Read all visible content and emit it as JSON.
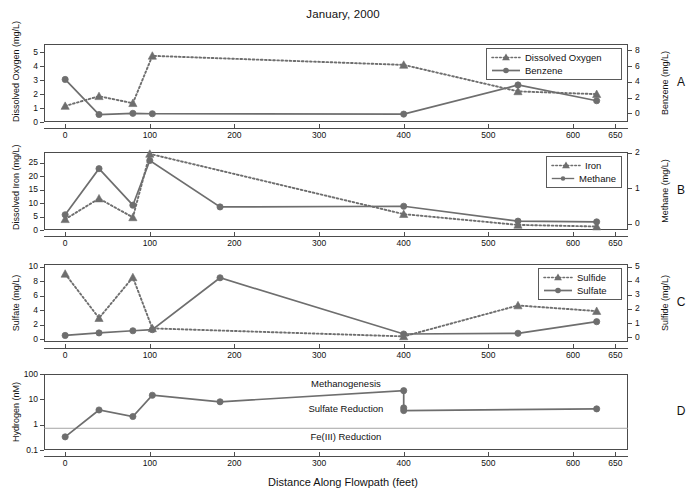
{
  "figure": {
    "title": "January, 2000",
    "xaxis_title": "Distance Along Flowpath (feet)",
    "xticks": [
      "0",
      "100",
      "200",
      "300",
      "400",
      "500",
      "600",
      "650"
    ],
    "xtick_values": [
      0,
      100,
      200,
      300,
      400,
      500,
      600,
      650
    ],
    "xlim": [
      -25,
      665
    ],
    "series_color": "#6e6e6e",
    "frame_color": "#4c4c4c"
  },
  "panels": [
    {
      "letter": "A",
      "left_axis_label": "Dissolved Oxygen (mg/L)",
      "right_axis_label": "Benzene (mg/L)",
      "left_ticks": [
        "0",
        "1",
        "2",
        "3",
        "4",
        "5"
      ],
      "left_tick_values": [
        0,
        1,
        2,
        3,
        4,
        5
      ],
      "left_lim": [
        0,
        5.6
      ],
      "right_ticks": [
        "0",
        "2",
        "4",
        "6",
        "8"
      ],
      "right_tick_values": [
        0,
        2,
        4,
        6,
        8
      ],
      "right_lim": [
        -1.1,
        8.8
      ],
      "legend": [
        {
          "label": "Dissolved Oxygen",
          "style": "dotted-triangle"
        },
        {
          "label": "Benzene",
          "style": "solid-circle"
        }
      ]
    },
    {
      "letter": "B",
      "left_axis_label": "Dissolved Iron (mg/L)",
      "right_axis_label": "Methane (mg/L)",
      "left_ticks": [
        "0",
        "5",
        "10",
        "15",
        "20",
        "25"
      ],
      "left_tick_values": [
        0,
        5,
        10,
        15,
        20,
        25
      ],
      "left_lim": [
        0,
        29
      ],
      "right_ticks": [
        "0",
        "1",
        "2"
      ],
      "right_tick_values": [
        0,
        1,
        2
      ],
      "right_lim": [
        -0.18,
        2.02
      ],
      "legend": [
        {
          "label": "Iron",
          "style": "dotted-triangle"
        },
        {
          "label": "Methane",
          "style": "solid-circle"
        }
      ]
    },
    {
      "letter": "C",
      "left_axis_label": "Sulfate (mg/L)",
      "right_axis_label": "Sulfide (mg/L)",
      "left_ticks": [
        "0",
        "2",
        "4",
        "6",
        "8",
        "10"
      ],
      "left_tick_values": [
        0,
        2,
        4,
        6,
        8,
        10
      ],
      "left_lim": [
        -0.35,
        10.4
      ],
      "right_ticks": [
        "0",
        "1",
        "2",
        "3",
        "4",
        "5"
      ],
      "right_tick_values": [
        0,
        1,
        2,
        3,
        4,
        5
      ],
      "right_lim": [
        -0.35,
        5.2
      ],
      "legend": [
        {
          "label": "Sulfide",
          "style": "dotted-triangle"
        },
        {
          "label": "Sulfate",
          "style": "solid-circle"
        }
      ]
    },
    {
      "letter": "D",
      "left_axis_label": "Hydrogen (nM)",
      "right_axis_label": "",
      "left_ticks": [
        "0.1",
        "1",
        "10",
        "100"
      ],
      "left_tick_values": [
        0.1,
        1,
        10,
        100
      ],
      "left_lim": [
        0.1,
        100
      ],
      "log_scale": true,
      "zone_labels": [
        {
          "text": "Methanogenesis",
          "value": 40
        },
        {
          "text": "Sulfate Reduction",
          "value": 4
        },
        {
          "text": "Fe(III) Reduction",
          "value": 0.33
        }
      ],
      "zone_dividers": [
        0.72
      ]
    }
  ],
  "chart_data": [
    {
      "type": "line",
      "panel": "A",
      "title": "January, 2000",
      "xlabel": "Distance Along Flowpath (feet)",
      "ylabel": "Dissolved Oxygen (mg/L)",
      "y2label": "Benzene (mg/L)",
      "xlim": [
        -25,
        665
      ],
      "ylim": [
        0,
        5.6
      ],
      "y2lim": [
        -1.1,
        8.8
      ],
      "grid": false,
      "legend_position": "top-right",
      "series": [
        {
          "name": "Dissolved Oxygen",
          "axis": "left",
          "marker": "triangle",
          "line": "dotted",
          "x": [
            0,
            40,
            80,
            103,
            400,
            535,
            628
          ],
          "values": [
            1.15,
            1.85,
            1.35,
            4.75,
            4.1,
            2.2,
            2.0
          ]
        },
        {
          "name": "Benzene",
          "axis": "right",
          "marker": "circle",
          "line": "solid",
          "x": [
            0,
            40,
            80,
            103,
            400,
            535,
            628
          ],
          "values": [
            4.3,
            -0.15,
            0.0,
            -0.05,
            -0.1,
            3.6,
            1.6
          ]
        }
      ]
    },
    {
      "type": "line",
      "panel": "B",
      "ylabel": "Dissolved Iron (mg/L)",
      "y2label": "Methane (mg/L)",
      "xlim": [
        -25,
        665
      ],
      "ylim": [
        0,
        29
      ],
      "y2lim": [
        -0.18,
        2.02
      ],
      "grid": false,
      "legend_position": "top-right",
      "series": [
        {
          "name": "Iron",
          "axis": "left",
          "marker": "triangle",
          "line": "dotted",
          "x": [
            0,
            40,
            80,
            100,
            400,
            535,
            628
          ],
          "values": [
            4.0,
            11.7,
            4.7,
            28.3,
            5.9,
            1.9,
            1.3
          ]
        },
        {
          "name": "Methane",
          "axis": "right",
          "marker": "circle",
          "line": "solid",
          "x": [
            0,
            40,
            80,
            100,
            183,
            400,
            535,
            628
          ],
          "values": [
            0.25,
            1.55,
            0.52,
            1.78,
            0.47,
            0.49,
            0.07,
            0.05
          ]
        }
      ]
    },
    {
      "type": "line",
      "panel": "C",
      "ylabel": "Sulfate (mg/L)",
      "y2label": "Sulfide (mg/L)",
      "xlim": [
        -25,
        665
      ],
      "ylim": [
        -0.35,
        10.4
      ],
      "y2lim": [
        -0.35,
        5.2
      ],
      "grid": false,
      "legend_position": "top-right",
      "series": [
        {
          "name": "Sulfide",
          "axis": "right",
          "marker": "triangle",
          "line": "dotted",
          "x": [
            0,
            40,
            80,
            103,
            400,
            535,
            628
          ],
          "values": [
            4.5,
            1.35,
            4.25,
            0.62,
            0.05,
            2.25,
            1.85
          ]
        },
        {
          "name": "Sulfate",
          "axis": "left",
          "marker": "circle",
          "line": "solid",
          "x": [
            0,
            40,
            80,
            103,
            183,
            400,
            535,
            628
          ],
          "values": [
            0.55,
            0.9,
            1.2,
            1.35,
            8.5,
            0.75,
            0.85,
            2.45
          ]
        }
      ]
    },
    {
      "type": "line",
      "panel": "D",
      "ylabel": "Hydrogen (nM)",
      "xlabel": "Distance Along Flowpath (feet)",
      "xlim": [
        -25,
        665
      ],
      "ylim": [
        0.1,
        100
      ],
      "yscale": "log",
      "grid": false,
      "annotations": [
        "Methanogenesis",
        "Sulfate Reduction",
        "Fe(III) Reduction"
      ],
      "series": [
        {
          "name": "Hydrogen",
          "axis": "left",
          "marker": "circle",
          "line": "solid",
          "x": [
            0,
            40,
            80,
            103,
            183,
            400,
            400,
            400,
            628
          ],
          "values": [
            0.33,
            3.8,
            2.1,
            14.5,
            8.0,
            22.0,
            4.6,
            3.6,
            4.2
          ]
        }
      ]
    }
  ]
}
